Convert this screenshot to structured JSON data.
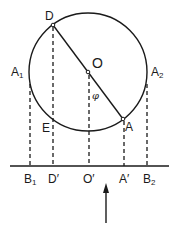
{
  "diagram": {
    "type": "geometry",
    "circle": {
      "center": "O",
      "cx": 88,
      "cy": 72,
      "r": 59
    },
    "points": {
      "D": {
        "label": "D",
        "x": 53,
        "y": 25
      },
      "O": {
        "label": "O",
        "x": 88,
        "y": 72
      },
      "A": {
        "label": "A",
        "x": 123,
        "y": 119
      },
      "A1": {
        "label": "A",
        "sub": "1",
        "x": 30,
        "y": 82
      },
      "A2": {
        "label": "A",
        "sub": "2",
        "x": 147,
        "y": 82
      },
      "E": {
        "label": "E",
        "x": 53,
        "y": 117
      }
    },
    "baseline_points": {
      "B1": {
        "label": "B",
        "sub": "1",
        "x": 30
      },
      "Dp": {
        "label": "D′",
        "x": 53
      },
      "Op": {
        "label": "O′",
        "x": 89
      },
      "Ap": {
        "label": "A′",
        "x": 124
      },
      "B2": {
        "label": "B",
        "sub": "2",
        "x": 147
      }
    },
    "angle_label": "φ",
    "baseline_y": 166,
    "arrow": {
      "direction": "up",
      "x": 106,
      "from_y": 223,
      "to_y": 183
    }
  }
}
